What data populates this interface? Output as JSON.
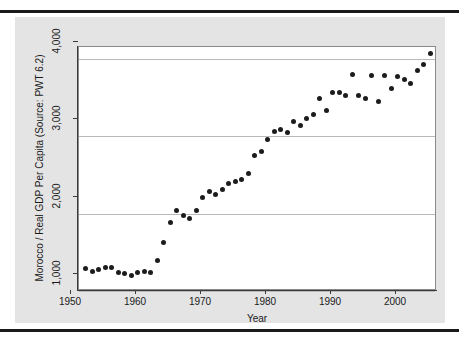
{
  "chart_data": {
    "type": "scatter",
    "title": "",
    "xlabel": "Year",
    "ylabel": "Morocco / Real GDP Per Capita (Source: PWT 6.2)",
    "xlim": [
      1949,
      2004
    ],
    "ylim": [
      1000,
      4150
    ],
    "grid": true,
    "legend": null,
    "marker_color": "#1c1c1c",
    "xticks": [
      1950,
      1960,
      1970,
      1980,
      1990,
      2000
    ],
    "xtick_labels": [
      "1950",
      "1960",
      "1970",
      "1980",
      "1990",
      "2000"
    ],
    "yticks": [
      1000,
      2000,
      3000,
      4000
    ],
    "ytick_labels": [
      "1,000",
      "2,000",
      "3,000",
      "4,000"
    ],
    "x": [
      1950,
      1951,
      1952,
      1953,
      1954,
      1955,
      1956,
      1957,
      1958,
      1959,
      1960,
      1961,
      1962,
      1963,
      1964,
      1965,
      1966,
      1967,
      1968,
      1969,
      1970,
      1971,
      1972,
      1973,
      1974,
      1975,
      1976,
      1977,
      1978,
      1979,
      1980,
      1981,
      1982,
      1983,
      1984,
      1985,
      1986,
      1987,
      1988,
      1989,
      1990,
      1991,
      1992,
      1993,
      1994,
      1995,
      1996,
      1997,
      1998,
      1999,
      2000,
      2001,
      2002,
      2003
    ],
    "y": [
      1290,
      1255,
      1280,
      1300,
      1300,
      1245,
      1230,
      1200,
      1240,
      1250,
      1245,
      1400,
      1620,
      1890,
      2040,
      1980,
      1940,
      2040,
      2210,
      2280,
      2250,
      2310,
      2390,
      2410,
      2440,
      2520,
      2750,
      2800,
      2960,
      3060,
      3080,
      3040,
      3190,
      3140,
      3230,
      3280,
      3490,
      3330,
      3560,
      3560,
      3520,
      3790,
      3530,
      3480,
      3780,
      3440,
      3780,
      3610,
      3770,
      3730,
      3680,
      3850,
      3920,
      4060
    ],
    "series": [
      {
        "name": "Real GDP Per Capita",
        "values": [
          1290,
          1255,
          1280,
          1300,
          1300,
          1245,
          1230,
          1200,
          1240,
          1250,
          1245,
          1400,
          1620,
          1890,
          2040,
          1980,
          1940,
          2040,
          2210,
          2280,
          2250,
          2310,
          2390,
          2410,
          2440,
          2520,
          2750,
          2800,
          2960,
          3060,
          3080,
          3040,
          3190,
          3140,
          3230,
          3280,
          3490,
          3330,
          3560,
          3560,
          3520,
          3790,
          3530,
          3480,
          3780,
          3440,
          3780,
          3610,
          3770,
          3730,
          3680,
          3850,
          3920,
          4060
        ]
      }
    ]
  },
  "axes": {
    "x_title": "Year",
    "y_title": "Morocco / Real GDP Per Capita (Source: PWT 6.2)"
  }
}
